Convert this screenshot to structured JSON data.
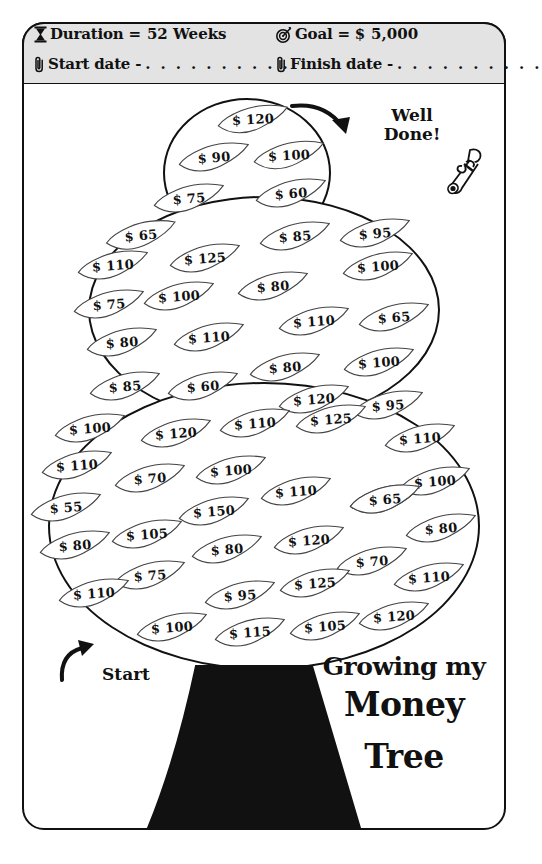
{
  "header": {
    "duration": {
      "icon": "hourglass-icon",
      "label": "Duration =",
      "value": "52 Weeks"
    },
    "goal": {
      "icon": "target-icon",
      "label": "Goal = $",
      "value": "5,000"
    },
    "start_date": {
      "icon": "paperclip-icon",
      "label": "Start date -",
      "value": ". . . . . . . . . ."
    },
    "finish_date": {
      "icon": "paperclip-icon",
      "label": "Finish date -",
      "value": ". . . . . . . . . ."
    }
  },
  "annotations": {
    "well_done_line1": "Well",
    "well_done_line2": "Done!",
    "start_label": "Start",
    "scroll_icon": "diploma-scroll-icon"
  },
  "title": {
    "line1": "Growing my",
    "line2": "Money",
    "line3": "Tree"
  },
  "colors": {
    "ink": "#111111",
    "header_fill": "#e3e3e3",
    "trunk": "#111111",
    "paper": "#ffffff"
  },
  "chart_data": {
    "type": "table",
    "title": "Growing my Money Tree",
    "xlabel": "Week",
    "ylabel": "Savings amount ($)",
    "currency": "$",
    "goal": 5000,
    "duration_weeks": 52,
    "values": [
      120,
      90,
      100,
      75,
      60,
      65,
      85,
      95,
      110,
      125,
      100,
      75,
      100,
      80,
      110,
      65,
      80,
      110,
      80,
      100,
      85,
      60,
      120,
      95,
      100,
      120,
      110,
      125,
      110,
      110,
      70,
      100,
      110,
      65,
      100,
      55,
      150,
      65,
      80,
      80,
      105,
      80,
      120,
      70,
      110,
      75,
      95,
      125,
      70,
      100,
      115,
      105,
      120
    ],
    "leaves": [
      {
        "amount": "$ 120",
        "x": 216,
        "y": 104,
        "rot": -3
      },
      {
        "amount": "$ 90",
        "x": 177,
        "y": 142,
        "rot": -4
      },
      {
        "amount": "$ 100",
        "x": 252,
        "y": 140,
        "rot": -3
      },
      {
        "amount": "$ 75",
        "x": 152,
        "y": 183,
        "rot": -4
      },
      {
        "amount": "$ 60",
        "x": 254,
        "y": 178,
        "rot": -4
      },
      {
        "amount": "$ 65",
        "x": 104,
        "y": 220,
        "rot": -5
      },
      {
        "amount": "$ 85",
        "x": 258,
        "y": 221,
        "rot": -4
      },
      {
        "amount": "$ 95",
        "x": 338,
        "y": 218,
        "rot": -4
      },
      {
        "amount": "$ 110",
        "x": 76,
        "y": 250,
        "rot": -4
      },
      {
        "amount": "$ 125",
        "x": 168,
        "y": 243,
        "rot": -4
      },
      {
        "amount": "$ 100",
        "x": 341,
        "y": 251,
        "rot": -4
      },
      {
        "amount": "$ 75",
        "x": 72,
        "y": 289,
        "rot": -4
      },
      {
        "amount": "$ 100",
        "x": 142,
        "y": 281,
        "rot": -4
      },
      {
        "amount": "$ 80",
        "x": 236,
        "y": 271,
        "rot": -4
      },
      {
        "amount": "$ 110",
        "x": 277,
        "y": 306,
        "rot": -4
      },
      {
        "amount": "$ 65",
        "x": 357,
        "y": 302,
        "rot": -4
      },
      {
        "amount": "$ 80",
        "x": 85,
        "y": 327,
        "rot": -4
      },
      {
        "amount": "$ 110",
        "x": 172,
        "y": 322,
        "rot": -4
      },
      {
        "amount": "$ 80",
        "x": 248,
        "y": 352,
        "rot": -4
      },
      {
        "amount": "$ 100",
        "x": 342,
        "y": 347,
        "rot": -4
      },
      {
        "amount": "$ 85",
        "x": 88,
        "y": 371,
        "rot": -4
      },
      {
        "amount": "$ 60",
        "x": 166,
        "y": 371,
        "rot": -4
      },
      {
        "amount": "$ 120",
        "x": 277,
        "y": 384,
        "rot": -4
      },
      {
        "amount": "$ 95",
        "x": 351,
        "y": 390,
        "rot": -4
      },
      {
        "amount": "$ 100",
        "x": 53,
        "y": 413,
        "rot": -4
      },
      {
        "amount": "$ 120",
        "x": 139,
        "y": 418,
        "rot": -4
      },
      {
        "amount": "$ 110",
        "x": 218,
        "y": 408,
        "rot": -4
      },
      {
        "amount": "$ 125",
        "x": 294,
        "y": 404,
        "rot": -4
      },
      {
        "amount": "$ 110",
        "x": 383,
        "y": 423,
        "rot": -4
      },
      {
        "amount": "$ 110",
        "x": 40,
        "y": 450,
        "rot": -4
      },
      {
        "amount": "$ 70",
        "x": 113,
        "y": 463,
        "rot": -4
      },
      {
        "amount": "$ 100",
        "x": 194,
        "y": 455,
        "rot": -4
      },
      {
        "amount": "$ 110",
        "x": 259,
        "y": 476,
        "rot": -4
      },
      {
        "amount": "$ 65",
        "x": 348,
        "y": 484,
        "rot": -4
      },
      {
        "amount": "$ 100",
        "x": 398,
        "y": 466,
        "rot": -4
      },
      {
        "amount": "$ 55",
        "x": 29,
        "y": 492,
        "rot": -4
      },
      {
        "amount": "$ 150",
        "x": 177,
        "y": 496,
        "rot": -4
      },
      {
        "amount": "$ 65",
        "x": 348,
        "y": 484,
        "rot": -4
      },
      {
        "amount": "$ 80",
        "x": 404,
        "y": 513,
        "rot": -4
      },
      {
        "amount": "$ 80",
        "x": 38,
        "y": 530,
        "rot": -4
      },
      {
        "amount": "$ 105",
        "x": 110,
        "y": 519,
        "rot": -4
      },
      {
        "amount": "$ 80",
        "x": 190,
        "y": 534,
        "rot": -4
      },
      {
        "amount": "$ 120",
        "x": 272,
        "y": 525,
        "rot": -4
      },
      {
        "amount": "$ 70",
        "x": 335,
        "y": 546,
        "rot": -4
      },
      {
        "amount": "$ 110",
        "x": 392,
        "y": 562,
        "rot": -4
      },
      {
        "amount": "$ 75",
        "x": 113,
        "y": 560,
        "rot": -4
      },
      {
        "amount": "$ 95",
        "x": 203,
        "y": 580,
        "rot": -4
      },
      {
        "amount": "$ 125",
        "x": 278,
        "y": 568,
        "rot": -4
      },
      {
        "amount": "$ 110",
        "x": 57,
        "y": 578,
        "rot": -4
      },
      {
        "amount": "$ 100",
        "x": 135,
        "y": 612,
        "rot": -4
      },
      {
        "amount": "$ 115",
        "x": 213,
        "y": 617,
        "rot": -4
      },
      {
        "amount": "$ 105",
        "x": 288,
        "y": 611,
        "rot": -4
      },
      {
        "amount": "$ 120",
        "x": 357,
        "y": 601,
        "rot": -4
      }
    ]
  }
}
